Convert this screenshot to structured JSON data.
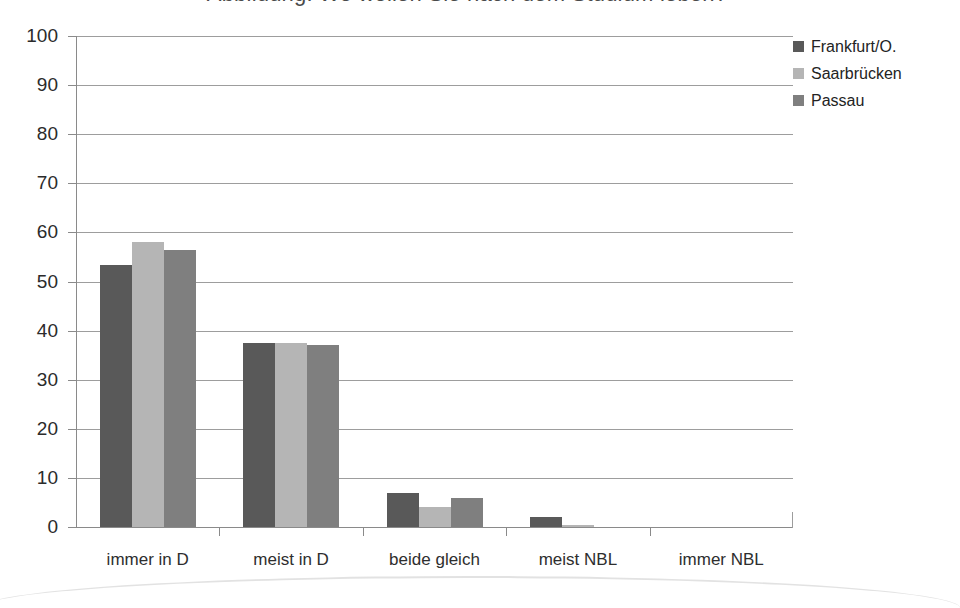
{
  "chart_data": {
    "type": "bar",
    "title": "",
    "xlabel": "",
    "ylabel": "",
    "ylim": [
      0,
      100
    ],
    "ytick_step": 10,
    "yticks": [
      "0",
      "10",
      "20",
      "30",
      "40",
      "50",
      "60",
      "70",
      "80",
      "90",
      "100"
    ],
    "grid": true,
    "legend_position": "right",
    "categories": [
      "immer in D",
      "meist in D",
      "beide gleich",
      "meist NBL",
      "immer NBL"
    ],
    "series": [
      {
        "name": "Frankfurt/O.",
        "color": "#595959",
        "values": [
          53.3,
          37.4,
          7.0,
          2.1,
          0.0
        ]
      },
      {
        "name": "Saarbrücken",
        "color": "#b5b5b5",
        "values": [
          58.0,
          37.4,
          4.1,
          0.5,
          0.0
        ]
      },
      {
        "name": "Passau",
        "color": "#7f7f7f",
        "values": [
          56.5,
          37.0,
          5.9,
          0.0,
          0.0
        ]
      }
    ]
  },
  "legend": {
    "items": [
      {
        "label": "Frankfurt/O.",
        "color": "#595959",
        "icon": "square-marker-icon"
      },
      {
        "label": "Saarbrücken",
        "color": "#b5b5b5",
        "icon": "square-marker-icon"
      },
      {
        "label": "Passau",
        "color": "#7f7f7f",
        "icon": "square-marker-icon"
      }
    ]
  },
  "scan": {
    "clipped_title": "Abbildung: Wo wollen Sie nach dem Studium leben?"
  },
  "colors": {
    "grid": "#9d9d9d",
    "axis": "#8a8a8a",
    "text": "#262626",
    "background": "#ffffff"
  }
}
